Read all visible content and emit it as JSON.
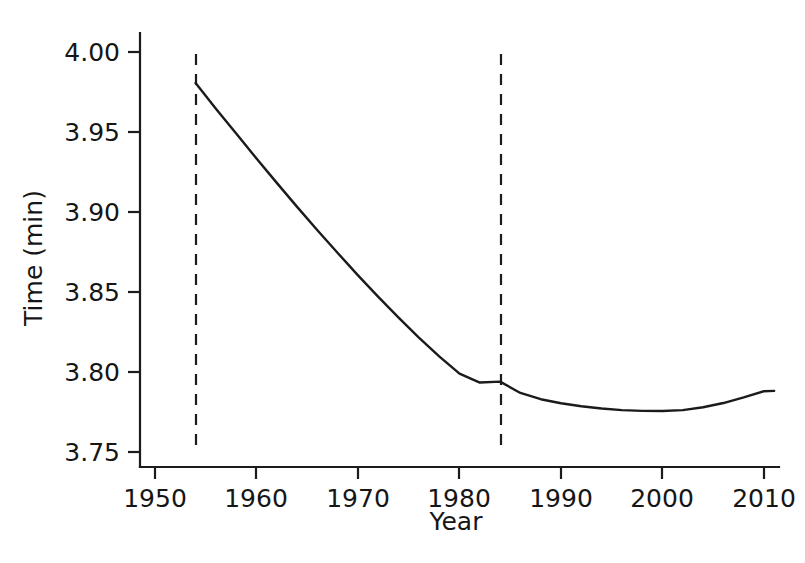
{
  "chart_data": {
    "type": "line",
    "title": "",
    "xlabel": "Year",
    "ylabel": "Time (min)",
    "xlim": [
      1946,
      1962
    ],
    "ylim": [
      3.7344,
      4.0125
    ],
    "xticks": [
      1950,
      1960,
      1970,
      1980,
      1990,
      2000,
      2010
    ],
    "yticks": [
      3.75,
      3.8,
      3.85,
      3.9,
      3.95,
      4.0
    ],
    "xtick_labels": [
      "1950",
      "1960",
      "1970",
      "1980",
      "1990",
      "2000",
      "2010"
    ],
    "ytick_labels": [
      "3.75",
      "3.80",
      "3.85",
      "3.90",
      "3.95",
      "4.00"
    ],
    "grid": false,
    "legend": null,
    "series": [
      {
        "name": "Fitted mile record time",
        "style": "solid",
        "color": "#1b1b1b",
        "x": [
          1954,
          1956,
          1958,
          1960,
          1962,
          1964,
          1966,
          1968,
          1970,
          1972,
          1974,
          1976,
          1978,
          1980,
          1982,
          1984,
          1986,
          1988,
          1990,
          1992,
          1994,
          1996,
          1998,
          2000,
          2002,
          2004,
          2006,
          2008,
          2010,
          2011
        ],
        "y": [
          3.9806,
          3.9646,
          3.949,
          3.9334,
          3.9182,
          3.9032,
          3.8886,
          3.8744,
          3.8604,
          3.847,
          3.834,
          3.8215,
          3.8098,
          3.799,
          3.7934,
          3.794,
          3.7869,
          3.783,
          3.7805,
          3.7786,
          3.7772,
          3.7762,
          3.7757,
          3.7756,
          3.7762,
          3.778,
          3.7806,
          3.7841,
          3.788,
          3.7882
        ]
      }
    ],
    "annotations": [
      {
        "kind": "vertical-reference-line",
        "name": "left-reference-line",
        "x": 1954,
        "style": "dashed",
        "color": "#1b1b1b"
      },
      {
        "kind": "vertical-reference-line",
        "name": "right-reference-line",
        "x": 1984,
        "style": "dashed",
        "color": "#1b1b1b"
      }
    ]
  },
  "axes": {
    "y_title": "Time (min)",
    "x_title": "Year"
  }
}
